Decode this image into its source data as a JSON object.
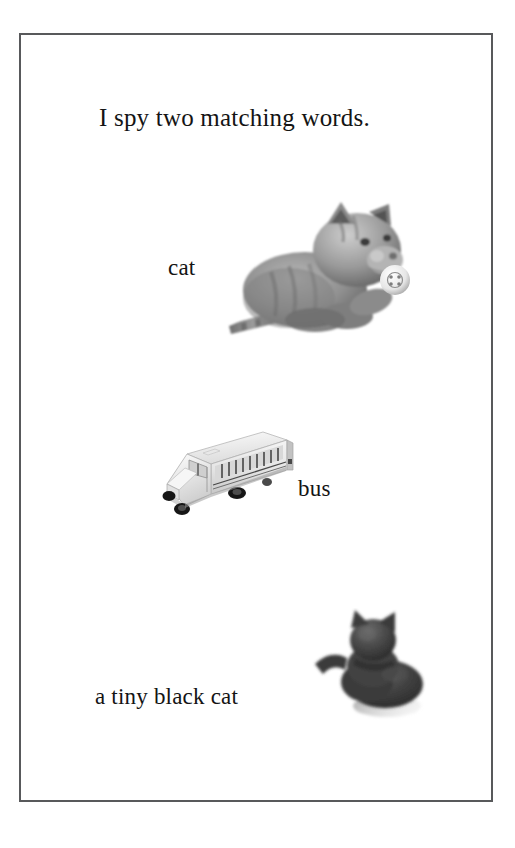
{
  "page": {
    "kind": "worksheet-page",
    "background_color": "#ffffff",
    "frame_color": "#58595b",
    "text_color": "#141414"
  },
  "prompt": {
    "title": "I spy two matching words."
  },
  "items": [
    {
      "label": "cat",
      "picture_name": "gray-cat-figurine-picture",
      "picture_description": "gray tabby cat figurine holding a small white ball",
      "picture_colors": {
        "body": "#8e8e8e",
        "shadow": "#4a4a4a",
        "ball": "#f2f2f2"
      }
    },
    {
      "label": "bus",
      "picture_name": "toy-school-bus-picture",
      "picture_description": "white toy school bus seen from the front left",
      "picture_colors": {
        "body": "#efefef",
        "shadow": "#bdbdbd",
        "wheels": "#1d1d1d"
      }
    },
    {
      "label": "a tiny black cat",
      "picture_name": "black-cat-figurine-picture",
      "picture_description": "small dark black cat figurine with raised tail",
      "picture_colors": {
        "body": "#3d3d3d",
        "shadow": "#6d6d6d"
      }
    }
  ]
}
